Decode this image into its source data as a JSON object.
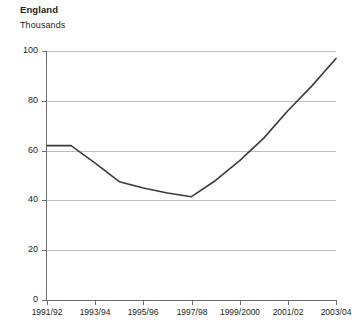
{
  "chart_data": {
    "type": "line",
    "title": "England",
    "subtitle": "Thousands",
    "ylabel": "Thousands",
    "xlabel": "",
    "grid": "horizontal",
    "legend": "none",
    "line_color": "#3b3b3b",
    "grid_color": "#bcbec0",
    "axis_color": "#6d6e71",
    "ylim": [
      0,
      100
    ],
    "yticks": [
      0,
      20,
      40,
      60,
      80,
      100
    ],
    "ytick_labels": [
      "0",
      "20",
      "40",
      "60",
      "80",
      "100"
    ],
    "categories": [
      "1991/92",
      "1992/93",
      "1993/94",
      "1994/95",
      "1995/96",
      "1996/97",
      "1997/98",
      "1998/99",
      "1999/2000",
      "2000/01",
      "2001/02",
      "2002/03",
      "2003/04"
    ],
    "xtick_labels": [
      "1991/92",
      "1993/94",
      "1995/96",
      "1997/98",
      "1999/2000",
      "2001/02",
      "2003/04"
    ],
    "values": [
      62,
      62,
      55,
      47.5,
      45,
      43,
      41.5,
      48,
      56,
      65,
      76,
      86,
      97
    ]
  }
}
